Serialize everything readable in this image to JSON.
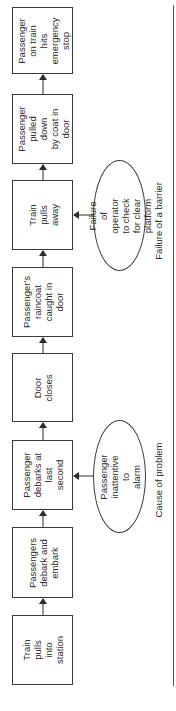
{
  "diagram": {
    "orientation": "rotated-90-ccw",
    "flow_direction": "bottom-to-top",
    "steps": [
      {
        "id": "step-1",
        "label": "Train pulls\ninto\nstation"
      },
      {
        "id": "step-2",
        "label": "Passengers\ndebark and\nembark"
      },
      {
        "id": "step-3",
        "label": "Passenger\ndebarks at\nlast second"
      },
      {
        "id": "step-4",
        "label": "Door\ncloses"
      },
      {
        "id": "step-5",
        "label": "Passenger's\nraincoat\ncaught in\ndoor"
      },
      {
        "id": "step-6",
        "label": "Train\npulls away"
      },
      {
        "id": "step-7",
        "label": "Passenger\npulled down\nby coat in\ndoor"
      },
      {
        "id": "step-8",
        "label": "Passenger\non train hits\nemergency\nstop"
      }
    ],
    "factors": [
      {
        "id": "factor-cause",
        "label": "Passenger\ninattentive to\nalarm",
        "points_to": "step-3"
      },
      {
        "id": "factor-barrier",
        "label": "Failure of operator\nto check for clear\nplatform",
        "points_to": "step-6"
      }
    ],
    "legend": {
      "cause": "Cause of problem",
      "barrier": "Failure of a barrier"
    },
    "colors": {
      "line": "#3a3a3a",
      "text": "#2a2a2a",
      "background": "#ffffff"
    }
  }
}
